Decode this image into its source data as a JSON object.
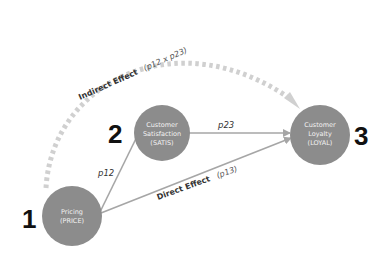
{
  "diagram": {
    "type": "mediation-model",
    "nodes": [
      {
        "id": "price",
        "number": "1",
        "line1": "Pricing",
        "line2": "(PRICE)",
        "line3": ""
      },
      {
        "id": "satis",
        "number": "2",
        "line1": "Customer",
        "line2": "Satisfaction",
        "line3": "(SATIS)"
      },
      {
        "id": "loyal",
        "number": "3",
        "line1": "Customer",
        "line2": "Loyalty",
        "line3": "(LOYAL)"
      }
    ],
    "edges": [
      {
        "from": "price",
        "to": "satis",
        "label": "p12"
      },
      {
        "from": "satis",
        "to": "loyal",
        "label": "p23"
      },
      {
        "from": "price",
        "to": "loyal",
        "label": "Direct Effect",
        "param": "(p13)"
      }
    ],
    "indirect": {
      "label": "Indirect Effect",
      "param": "(p12 x p23)"
    },
    "colors": {
      "node_fill": "#8c8c8c",
      "node_text": "#f2f2f2",
      "edge": "#a6a6a6",
      "dotted_arc": "#d0d0d0",
      "number": "#111111"
    }
  }
}
